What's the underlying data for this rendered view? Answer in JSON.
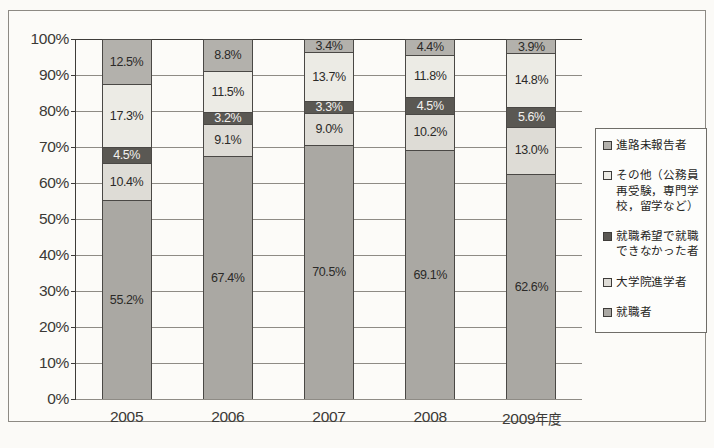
{
  "chart_data": {
    "type": "bar",
    "title": "",
    "subtitle": "",
    "stacked": true,
    "stack_mode": "percent",
    "xlabel": "",
    "ylabel": "",
    "ylim": [
      0,
      100
    ],
    "yticks": [
      "0%",
      "10%",
      "20%",
      "30%",
      "40%",
      "50%",
      "60%",
      "70%",
      "80%",
      "90%",
      "100%"
    ],
    "ytick_values": [
      0,
      10,
      20,
      30,
      40,
      50,
      60,
      70,
      80,
      90,
      100
    ],
    "grid": true,
    "grid_axis": "y",
    "legend_position": "right",
    "categories": [
      "2005",
      "2006",
      "2007",
      "2008",
      "2009"
    ],
    "category_labels": [
      "2005",
      "2006",
      "2007",
      "2008",
      "2009年度"
    ],
    "category_suffix_last": "年度",
    "series": [
      {
        "name": "就職者",
        "key": "s0",
        "color": "#aaa8a3",
        "values": [
          55.2,
          67.4,
          70.5,
          69.1,
          62.6
        ],
        "labels": [
          "55.2%",
          "67.4%",
          "70.5%",
          "69.1%",
          "62.6%"
        ]
      },
      {
        "name": "大学院進学者",
        "key": "s1",
        "color": "#dedcd6",
        "values": [
          10.4,
          9.1,
          9.0,
          10.2,
          13.0
        ],
        "labels": [
          "10.4%",
          "9.1%",
          "9.0%",
          "10.2%",
          "13.0%"
        ]
      },
      {
        "name": "就職希望で就職できなかった者",
        "key": "s2",
        "color": "#5a5853",
        "values": [
          4.5,
          3.2,
          3.3,
          4.5,
          5.6
        ],
        "labels": [
          "4.5%",
          "3.2%",
          "3.3%",
          "4.5%",
          "5.6%"
        ]
      },
      {
        "name": "その他（公務員再受験，専門学校，留学など）",
        "key": "s3",
        "color": "#ecebe5",
        "values": [
          17.3,
          11.5,
          13.7,
          11.8,
          14.8
        ],
        "labels": [
          "17.3%",
          "11.5%",
          "13.7%",
          "11.8%",
          "14.8%"
        ]
      },
      {
        "name": "進路未報告者",
        "key": "s4",
        "color": "#b3b1ac",
        "values": [
          12.5,
          8.8,
          3.4,
          4.4,
          3.9
        ],
        "labels": [
          "12.5%",
          "8.8%",
          "3.4%",
          "4.4%",
          "3.9%"
        ]
      }
    ]
  },
  "legend": {
    "items": [
      {
        "key": "s4",
        "color": "#b3b1ac",
        "label": "進路未報告者"
      },
      {
        "key": "s3",
        "color": "#ecebe5",
        "label": "その他（公務員再受験，専門学校，留学など）"
      },
      {
        "key": "s2",
        "color": "#5a5853",
        "label": "就職希望で就職できなかった者"
      },
      {
        "key": "s1",
        "color": "#dedcd6",
        "label": "大学院進学者"
      },
      {
        "key": "s0",
        "color": "#aaa8a3",
        "label": "就職者"
      }
    ]
  }
}
